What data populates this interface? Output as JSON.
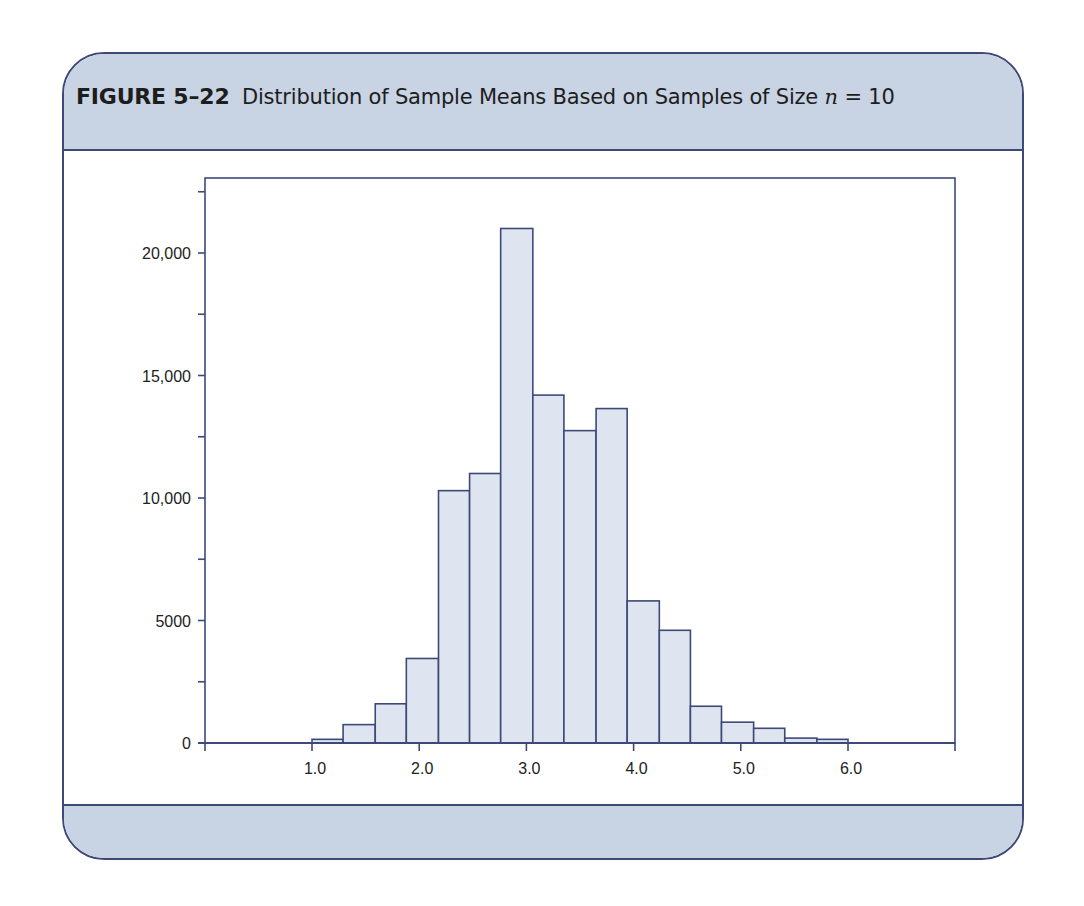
{
  "figure": {
    "label": "FIGURE 5–22",
    "caption_pre": "Distribution of Sample Means Based on Samples of Size",
    "caption_var": "n",
    "caption_post": "= 10"
  },
  "colors": {
    "frame_border": "#3d4a78",
    "panel_fill": "#c8d3e3",
    "bar_fill": "#dfe5f0",
    "bar_stroke": "#3d4a78",
    "axis": "#3d4a78"
  },
  "chart_data": {
    "type": "bar",
    "title": "Distribution of Sample Means Based on Samples of Size n = 10",
    "xlabel": "",
    "ylabel": "",
    "bin_start": 1.0,
    "bin_end": 6.0,
    "bin_count": 17,
    "bins": [
      [
        1.0,
        1.29
      ],
      [
        1.29,
        1.59
      ],
      [
        1.59,
        1.88
      ],
      [
        1.88,
        2.18
      ],
      [
        2.18,
        2.47
      ],
      [
        2.47,
        2.76
      ],
      [
        2.76,
        3.06
      ],
      [
        3.06,
        3.35
      ],
      [
        3.35,
        3.65
      ],
      [
        3.65,
        3.94
      ],
      [
        3.94,
        4.24
      ],
      [
        4.24,
        4.53
      ],
      [
        4.53,
        4.82
      ],
      [
        4.82,
        5.12
      ],
      [
        5.12,
        5.41
      ],
      [
        5.41,
        5.71
      ],
      [
        5.71,
        6.0
      ]
    ],
    "values": [
      150,
      750,
      1600,
      3450,
      10300,
      11000,
      21000,
      14200,
      12750,
      13650,
      5800,
      4600,
      1500,
      850,
      600,
      200,
      150
    ],
    "xlim": [
      0.0,
      7.0
    ],
    "ylim": [
      0,
      23100
    ],
    "x_ticks": [
      1.0,
      2.0,
      3.0,
      4.0,
      5.0,
      6.0
    ],
    "x_tick_labels": [
      "1.0",
      "2.0",
      "3.0",
      "4.0",
      "5.0",
      "6.0"
    ],
    "y_ticks": [
      0,
      2500,
      5000,
      7500,
      10000,
      12500,
      15000,
      17500,
      20000,
      22500
    ],
    "y_tick_labels": [
      {
        "value": 0,
        "label": "0"
      },
      {
        "value": 5000,
        "label": "5000"
      },
      {
        "value": 10000,
        "label": "10,000"
      },
      {
        "value": 15000,
        "label": "15,000"
      },
      {
        "value": 20000,
        "label": "20,000"
      }
    ],
    "grid": false,
    "legend": null
  }
}
